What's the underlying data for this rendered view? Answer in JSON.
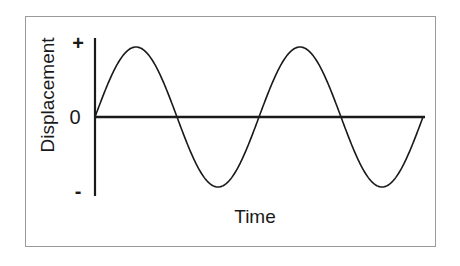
{
  "figure": {
    "background_color": "#ffffff",
    "frame_color": "#9a9a9a",
    "ink_color": "#1a1a1a"
  },
  "labels": {
    "y_axis_title": "Displacement",
    "x_axis_title": "Time",
    "y_tick_positive": "+",
    "y_tick_zero": "0",
    "y_tick_negative": "-"
  },
  "chart_data": {
    "type": "line",
    "title": "",
    "subtitle": "",
    "xlabel": "Time",
    "ylabel": "Displacement",
    "grid": false,
    "legend": false,
    "annotations": [],
    "xlim": [
      0,
      2.05
    ],
    "ylim": [
      -1.15,
      1.15
    ],
    "xtick_labels": [],
    "ytick_labels": [
      "+",
      "0",
      "-"
    ],
    "ytick_values": [
      1,
      0,
      -1
    ],
    "series": [
      {
        "name": "Displacement waveform",
        "function": "sine",
        "amplitude": 1,
        "cycles": 2,
        "phase": 0,
        "stroke_color": "#1a1a1a",
        "stroke_width": 1.6,
        "key_points": [
          {
            "label": "origin",
            "x": 0.0,
            "y": 0
          },
          {
            "label": "crest-1",
            "x": 0.25,
            "y": 1
          },
          {
            "label": "zero-1",
            "x": 0.5,
            "y": 0
          },
          {
            "label": "trough-1",
            "x": 0.75,
            "y": -1
          },
          {
            "label": "zero-2",
            "x": 1.0,
            "y": 0
          },
          {
            "label": "crest-2",
            "x": 1.25,
            "y": 1
          },
          {
            "label": "zero-3",
            "x": 1.5,
            "y": 0
          },
          {
            "label": "trough-2",
            "x": 1.75,
            "y": -1
          },
          {
            "label": "end",
            "x": 2.0,
            "y": 0
          }
        ],
        "x": [
          0.0,
          0.05,
          0.1,
          0.15,
          0.2,
          0.25,
          0.3,
          0.35,
          0.4,
          0.45,
          0.5,
          0.55,
          0.6,
          0.65,
          0.7,
          0.75,
          0.8,
          0.85,
          0.9,
          0.95,
          1.0,
          1.05,
          1.1,
          1.15,
          1.2,
          1.25,
          1.3,
          1.35,
          1.4,
          1.45,
          1.5,
          1.55,
          1.6,
          1.65,
          1.7,
          1.75,
          1.8,
          1.85,
          1.9,
          1.95,
          2.0
        ],
        "values": [
          0.0,
          0.31,
          0.59,
          0.81,
          0.95,
          1.0,
          0.95,
          0.81,
          0.59,
          0.31,
          0.0,
          -0.31,
          -0.59,
          -0.81,
          -0.95,
          -1.0,
          -0.95,
          -0.81,
          -0.59,
          -0.31,
          0.0,
          0.31,
          0.59,
          0.81,
          0.95,
          1.0,
          0.95,
          0.81,
          0.59,
          0.31,
          0.0,
          -0.31,
          -0.59,
          -0.81,
          -0.95,
          -1.0,
          -0.95,
          -0.81,
          -0.59,
          -0.31,
          0.0
        ]
      }
    ],
    "axes_geometry": {
      "origin_px": [
        95,
        117
      ],
      "x_axis_end_px": [
        425,
        117
      ],
      "y_axis_top_px": [
        95,
        38
      ],
      "y_axis_bottom_px": [
        95,
        196
      ],
      "amplitude_px": 70,
      "period_px": 164
    }
  }
}
